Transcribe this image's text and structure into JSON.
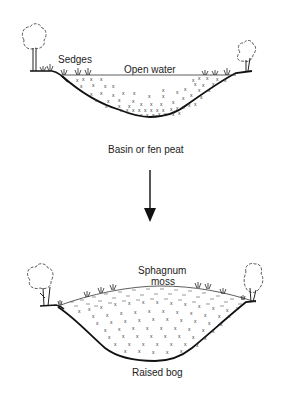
{
  "diagram": {
    "stage1": {
      "labels": {
        "sedges": "Sedges",
        "open_water": "Open water",
        "caption": "Basin or fen peat"
      }
    },
    "arrow": {
      "direction": "down"
    },
    "stage2": {
      "labels": {
        "sphagnum_line1": "Sphagnum",
        "sphagnum_line2": "moss",
        "caption": "Raised bog"
      }
    },
    "colors": {
      "ink": "#1a1a1a",
      "background": "#ffffff"
    }
  }
}
